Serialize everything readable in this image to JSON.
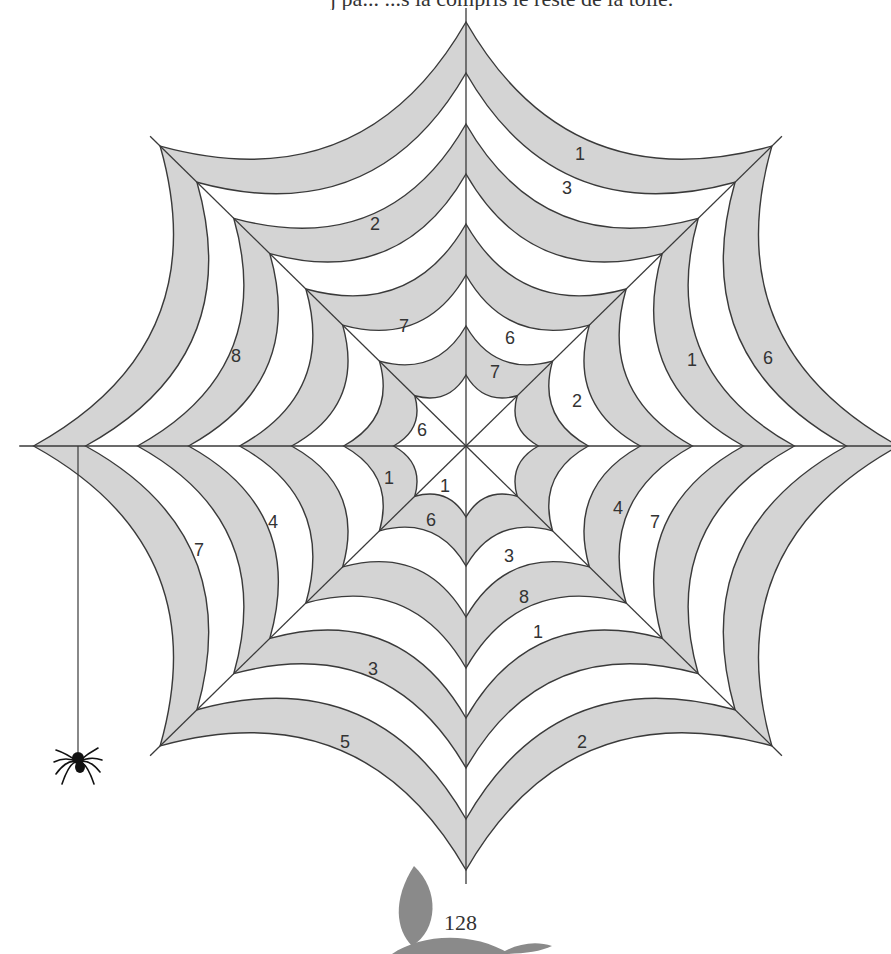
{
  "header": {
    "partial_text": "j   pa... ...s la compris le reste de la toile."
  },
  "page": {
    "number": "128"
  },
  "colors": {
    "band_gray": "#d4d4d4",
    "band_white": "#ffffff",
    "line": "#3a3a3a",
    "leaf": "#8a8a8a",
    "spider": "#111111"
  },
  "web": {
    "center": [
      466,
      446
    ],
    "spokes": 8,
    "ring_radii": [
      71,
      120,
      171,
      222,
      272,
      322,
      373,
      424
    ],
    "radius_scale_x": 1.02,
    "spoke_extension": 14,
    "arc_bow": 0.3,
    "band_fill_pattern": [
      "gray",
      "white",
      "gray",
      "white",
      "gray",
      "white",
      "gray"
    ],
    "inner_fill": "white",
    "labels": [
      {
        "text": "1",
        "x": 580,
        "y": 160
      },
      {
        "text": "3",
        "x": 567,
        "y": 194
      },
      {
        "text": "2",
        "x": 375,
        "y": 230
      },
      {
        "text": "7",
        "x": 404,
        "y": 332
      },
      {
        "text": "8",
        "x": 236,
        "y": 362
      },
      {
        "text": "6",
        "x": 510,
        "y": 344
      },
      {
        "text": "7",
        "x": 495,
        "y": 378
      },
      {
        "text": "2",
        "x": 577,
        "y": 407
      },
      {
        "text": "1",
        "x": 692,
        "y": 366
      },
      {
        "text": "6",
        "x": 768,
        "y": 364
      },
      {
        "text": "6",
        "x": 422,
        "y": 436
      },
      {
        "text": "1",
        "x": 389,
        "y": 484
      },
      {
        "text": "1",
        "x": 445,
        "y": 492
      },
      {
        "text": "6",
        "x": 431,
        "y": 526
      },
      {
        "text": "4",
        "x": 273,
        "y": 528
      },
      {
        "text": "7",
        "x": 199,
        "y": 556
      },
      {
        "text": "4",
        "x": 618,
        "y": 514
      },
      {
        "text": "7",
        "x": 655,
        "y": 528
      },
      {
        "text": "3",
        "x": 509,
        "y": 562
      },
      {
        "text": "8",
        "x": 524,
        "y": 603
      },
      {
        "text": "1",
        "x": 538,
        "y": 638
      },
      {
        "text": "3",
        "x": 373,
        "y": 675
      },
      {
        "text": "5",
        "x": 345,
        "y": 748
      },
      {
        "text": "2",
        "x": 582,
        "y": 748
      }
    ]
  },
  "spider": {
    "thread_x": 78,
    "thread_top": 446,
    "body_x": 78,
    "body_y": 758
  }
}
